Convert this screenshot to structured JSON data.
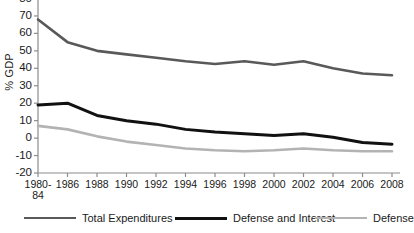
{
  "chart_data": {
    "type": "line",
    "title": "",
    "xlabel": "",
    "ylabel": "% GDP",
    "ylim": [
      -20,
      80
    ],
    "yticks": [
      80,
      70,
      60,
      50,
      40,
      30,
      20,
      10,
      0,
      -10,
      -20
    ],
    "ytick_labels": [
      "80",
      "70",
      "60",
      "50",
      "40",
      "30",
      "20",
      "10",
      "0",
      "-10",
      "-20"
    ],
    "grid": false,
    "legend_position": "bottom",
    "x": [
      "1980-84",
      "1986",
      "1988",
      "1990",
      "1992",
      "1994",
      "1996",
      "1998",
      "2000",
      "2002",
      "2004",
      "2006",
      "2008"
    ],
    "xtick_labels": [
      {
        "line1": "1980-",
        "line2": "84"
      },
      {
        "line1": "1986",
        "line2": ""
      },
      {
        "line1": "1988",
        "line2": ""
      },
      {
        "line1": "1990",
        "line2": ""
      },
      {
        "line1": "1992",
        "line2": ""
      },
      {
        "line1": "1994",
        "line2": ""
      },
      {
        "line1": "1996",
        "line2": ""
      },
      {
        "line1": "1998",
        "line2": ""
      },
      {
        "line1": "2000",
        "line2": ""
      },
      {
        "line1": "2002",
        "line2": ""
      },
      {
        "line1": "2004",
        "line2": ""
      },
      {
        "line1": "2006",
        "line2": ""
      },
      {
        "line1": "2008",
        "line2": ""
      }
    ],
    "series": [
      {
        "name": "Total Expenditures",
        "color": "#595959",
        "width": 2.6,
        "values": [
          68,
          55,
          50,
          48,
          46,
          44,
          42.5,
          44,
          42,
          44,
          40,
          37,
          36
        ]
      },
      {
        "name": "Defense and Interest",
        "color": "#111111",
        "width": 3.0,
        "values": [
          19,
          20,
          13,
          10,
          8,
          5,
          3.5,
          2.5,
          1.5,
          2.5,
          0.5,
          -2.5,
          -3.5
        ]
      },
      {
        "name": "Defense",
        "color": "#b3b3b3",
        "width": 2.6,
        "values": [
          7,
          5,
          1,
          -2,
          -4,
          -6,
          -7,
          -7.5,
          -7,
          -6,
          -7,
          -7.5,
          -7.5
        ]
      }
    ]
  },
  "legend": {
    "entries": [
      {
        "label": "Total Expenditures",
        "color": "#595959",
        "width": 2.6
      },
      {
        "label": "Defense and Interest",
        "color": "#111111",
        "width": 3.2
      },
      {
        "label": "Defense",
        "color": "#b3b3b3",
        "width": 2.4
      }
    ]
  },
  "axis": {
    "axis_color": "#8c8c8c",
    "tick_color": "#8c8c8c"
  }
}
